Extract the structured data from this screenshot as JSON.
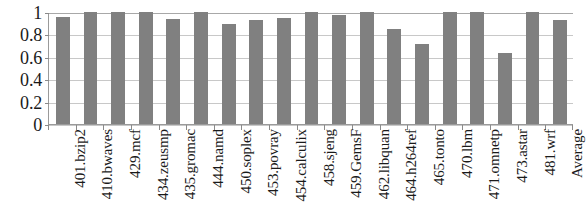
{
  "chart_data": {
    "type": "bar",
    "title": "",
    "subtitle": "",
    "xlabel": "",
    "ylabel": "",
    "ylim": [
      0,
      1
    ],
    "xlim": null,
    "grid": true,
    "legend": false,
    "legend_position": "none",
    "bar_color": "#808080",
    "gridline_color": "#c8c8c8",
    "axis_color": "#9a9a9a",
    "y_ticks": [
      "0",
      "0.2",
      "0.4",
      "0.6",
      "0.8",
      "1"
    ],
    "y_tick_values": [
      0,
      0.2,
      0.4,
      0.6,
      0.8,
      1
    ],
    "categories": [
      "401.bzip2",
      "410.bwaves",
      "429.mcf",
      "434.zeusmp",
      "435.gromac",
      "444.namd",
      "450.soplex",
      "453.povray",
      "454.calculix",
      "458.sjeng",
      "459.GemsF",
      "462.libquan",
      "464.h264ref",
      "465.tonto",
      "470.lbm",
      "471.omnetp",
      "473.astar",
      "481.wrf",
      "Average"
    ],
    "values": [
      0.955,
      1.0,
      1.0,
      1.0,
      0.94,
      1.0,
      0.895,
      0.925,
      0.945,
      1.0,
      0.97,
      1.0,
      0.845,
      0.71,
      1.0,
      1.0,
      0.635,
      1.0,
      0.93
    ]
  }
}
